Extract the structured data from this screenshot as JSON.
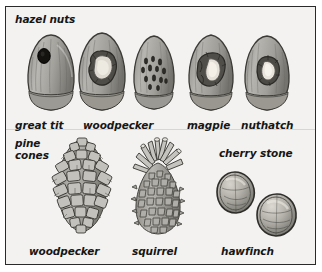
{
  "plate": {
    "title": "feeding signs on hazel nuts, pine cones and cherry stones",
    "background_color": "#f3f2f0",
    "border_color": "#2a2a2a",
    "ink_color": "#161616",
    "panels": [
      {
        "id": "hazel-nuts",
        "group_label": "hazel nuts",
        "specimens": [
          {
            "id": "nut-great-tit",
            "label": "great tit",
            "damage": "small round hole"
          },
          {
            "id": "nut-woodpecker",
            "label": "woodpecker",
            "damage": "large ragged hole"
          },
          {
            "id": "nut-magpie-pits",
            "label": "",
            "damage": "many small elongated pecks"
          },
          {
            "id": "nut-magpie",
            "label": "magpie",
            "damage": "wide jagged opening"
          },
          {
            "id": "nut-nuthatch",
            "label": "nuthatch",
            "damage": "chipped irregular hole"
          }
        ]
      },
      {
        "id": "pine-cones",
        "group_label": "pine cones",
        "specimens": [
          {
            "id": "cone-woodpecker",
            "label": "woodpecker",
            "damage": "scales splayed and torn outward"
          },
          {
            "id": "cone-squirrel",
            "label": "squirrel",
            "damage": "stripped to core with tuft at tip"
          }
        ]
      },
      {
        "id": "cherry-stones",
        "group_label": "cherry stone",
        "specimens": [
          {
            "id": "stone-hawfinch-left",
            "label": "hawfinch",
            "damage": "split along seam"
          },
          {
            "id": "stone-hawfinch-right",
            "label": "",
            "damage": "split along seam"
          }
        ]
      }
    ],
    "labels": {
      "hazel_nuts": "hazel nuts",
      "great_tit": "great tit",
      "woodpecker_nut": "woodpecker",
      "magpie": "magpie",
      "nuthatch": "nuthatch",
      "pine_cones_line1": "pine",
      "pine_cones_line2": "cones",
      "woodpecker_cone": "woodpecker",
      "squirrel": "squirrel",
      "cherry_stone": "cherry stone",
      "hawfinch": "hawfinch"
    }
  }
}
